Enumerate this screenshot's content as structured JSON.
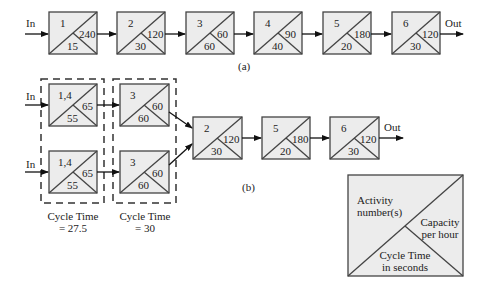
{
  "diagram_a": {
    "label": "(a)",
    "input_label": "In",
    "output_label": "Out",
    "stations": [
      {
        "activity": "1",
        "capacity": "240",
        "cycle_time": "15"
      },
      {
        "activity": "2",
        "capacity": "120",
        "cycle_time": "30"
      },
      {
        "activity": "3",
        "capacity": "60",
        "cycle_time": "60"
      },
      {
        "activity": "4",
        "capacity": "90",
        "cycle_time": "40"
      },
      {
        "activity": "5",
        "capacity": "180",
        "cycle_time": "20"
      },
      {
        "activity": "6",
        "capacity": "120",
        "cycle_time": "30"
      }
    ]
  },
  "diagram_b": {
    "label": "(b)",
    "input_label_top": "In",
    "input_label_bottom": "In",
    "output_label": "Out",
    "parallel_top": [
      {
        "activity": "1,4",
        "capacity": "65",
        "cycle_time": "55"
      },
      {
        "activity": "3",
        "capacity": "60",
        "cycle_time": "60"
      }
    ],
    "parallel_bottom": [
      {
        "activity": "1,4",
        "capacity": "65",
        "cycle_time": "55"
      },
      {
        "activity": "3",
        "capacity": "60",
        "cycle_time": "60"
      }
    ],
    "serial": [
      {
        "activity": "2",
        "capacity": "120",
        "cycle_time": "30"
      },
      {
        "activity": "5",
        "capacity": "180",
        "cycle_time": "20"
      },
      {
        "activity": "6",
        "capacity": "120",
        "cycle_time": "30"
      }
    ],
    "groups": [
      {
        "caption_line1": "Cycle Time",
        "caption_line2": "= 27.5"
      },
      {
        "caption_line1": "Cycle Time",
        "caption_line2": "= 30"
      }
    ]
  },
  "legend": {
    "top_left": [
      "Activity",
      "number(s)"
    ],
    "right": [
      "Capacity",
      "per hour"
    ],
    "bottom": [
      "Cycle Time",
      "in seconds"
    ]
  },
  "colors": {
    "box_fill": "#ececec",
    "stroke": "#444444",
    "text": "#222222"
  }
}
